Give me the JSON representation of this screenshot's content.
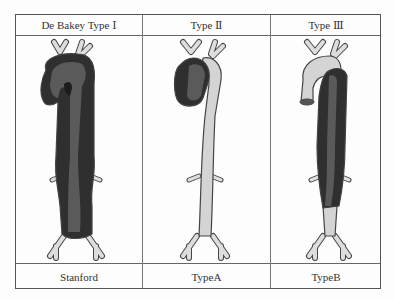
{
  "header": {
    "col1": "De Bakey Type Ⅰ",
    "col2": "Type Ⅱ",
    "col3": "Type Ⅲ"
  },
  "footer": {
    "col1": "Stanford",
    "col2": "TypeA",
    "col3": "TypeB"
  },
  "illustrations": [
    {
      "name": "aorta-type-1",
      "dissection_extent": "ascending, arch and descending aorta"
    },
    {
      "name": "aorta-type-2",
      "dissection_extent": "ascending aorta only"
    },
    {
      "name": "aorta-type-3",
      "dissection_extent": "descending aorta only"
    }
  ],
  "colors": {
    "dissection_dark": "#2f2f2f",
    "lumen_mid": "#5a5a5a",
    "normal_light": "#d4d4d4",
    "outline": "#444444",
    "border": "#555555"
  }
}
